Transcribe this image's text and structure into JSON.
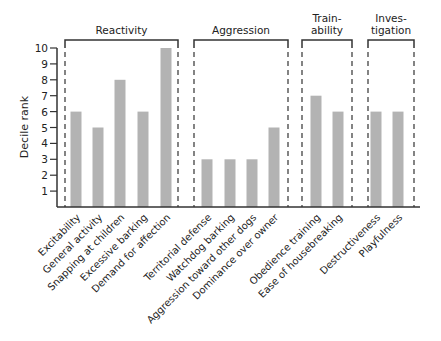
{
  "chart_data": {
    "type": "bar",
    "title": "",
    "xlabel": "",
    "ylabel": "Decile rank",
    "ylim": [
      0,
      10
    ],
    "yticks": [
      1,
      2,
      3,
      4,
      5,
      6,
      7,
      8,
      9,
      10
    ],
    "grid": false,
    "legend": null,
    "bar_color": "#b3b3b3",
    "groups": [
      {
        "name": "Reactivity",
        "label_lines": [
          "Reactivity"
        ],
        "categories": [
          "Excitability",
          "General activity",
          "Snapping at children",
          "Excessive barking",
          "Demand for affection"
        ],
        "values": [
          6,
          5,
          8,
          6,
          10
        ]
      },
      {
        "name": "Aggression",
        "label_lines": [
          "Aggression"
        ],
        "categories": [
          "Territorial defense",
          "Watchdog barking",
          "Aggression toward other dogs",
          "Dominance over owner"
        ],
        "values": [
          3,
          3,
          3,
          5
        ]
      },
      {
        "name": "Trainability",
        "label_lines": [
          "Train-",
          "ability"
        ],
        "categories": [
          "Obedience training",
          "Ease of housebreaking"
        ],
        "values": [
          7,
          6
        ]
      },
      {
        "name": "Investigation",
        "label_lines": [
          "Inves-",
          "tigation"
        ],
        "categories": [
          "Destructiveness",
          "Playfulness"
        ],
        "values": [
          6,
          6
        ]
      }
    ],
    "categories": [
      "Excitability",
      "General activity",
      "Snapping at children",
      "Excessive barking",
      "Demand for affection",
      "Territorial defense",
      "Watchdog barking",
      "Aggression toward other dogs",
      "Dominance over owner",
      "Obedience training",
      "Ease of housebreaking",
      "Destructiveness",
      "Playfulness"
    ],
    "values": [
      6,
      5,
      8,
      6,
      10,
      3,
      3,
      3,
      5,
      7,
      6,
      6,
      6
    ]
  }
}
